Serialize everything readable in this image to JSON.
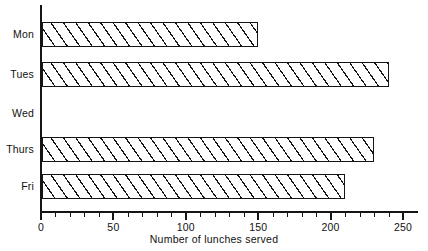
{
  "chart_data": {
    "type": "bar",
    "orientation": "horizontal",
    "title": "",
    "xlabel": "Number of lunches served",
    "ylabel": "",
    "categories": [
      "Mon",
      "Tues",
      "Wed",
      "Thurs",
      "Fri"
    ],
    "values": [
      150,
      240,
      0,
      230,
      210
    ],
    "xlim": [
      0,
      262
    ],
    "xticks": [
      0,
      50,
      100,
      150,
      200,
      250
    ],
    "xtick_labels": [
      "0",
      "50",
      "100",
      "150",
      "200",
      "250"
    ],
    "minor_tick_step": 10,
    "grid": false,
    "legend": null,
    "bar_fill": "diagonal-hatch",
    "bar_edge_color": "#151515",
    "bar_face_color": "#ffffff",
    "axis_color": "#151515"
  },
  "axis": {
    "x_title": "Number of lunches served"
  }
}
